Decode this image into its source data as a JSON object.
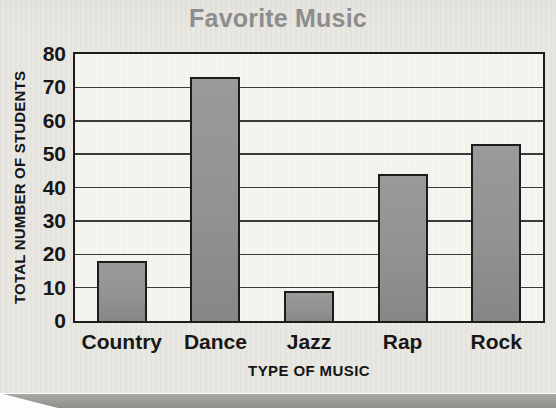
{
  "colors": {
    "card_background": "#e9e7e1",
    "plot_background": "#f5f4ef",
    "bar_fill": "#929292",
    "bar_border": "#1c1c1c",
    "gridline": "#3a3a3a",
    "title_text": "#8d8d8d",
    "axis_text": "#171717",
    "page_edge": "#9a9a97"
  },
  "chart_data": {
    "type": "bar",
    "title": "Favorite Music",
    "categories": [
      "Country",
      "Dance",
      "Jazz",
      "Rap",
      "Rock"
    ],
    "values": [
      18,
      73,
      9,
      44,
      53
    ],
    "xlabel": "TYPE OF MUSIC",
    "ylabel": "TOTAL NUMBER OF STUDENTS",
    "ylim": [
      0,
      80
    ],
    "yticks": [
      0,
      10,
      20,
      30,
      40,
      50,
      60,
      70,
      80
    ],
    "grid": true,
    "legend": "none"
  }
}
